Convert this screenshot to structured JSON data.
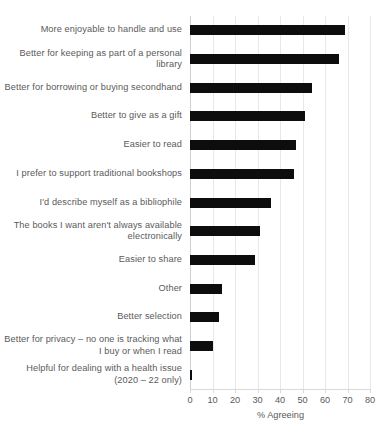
{
  "chart_data": {
    "type": "bar",
    "orientation": "horizontal",
    "title": "",
    "xlabel": "% Agreeing",
    "ylabel": "",
    "xlim": [
      0,
      80
    ],
    "xticks": [
      0,
      10,
      20,
      30,
      40,
      50,
      60,
      70,
      80
    ],
    "grid": true,
    "legend": false,
    "bar_color": "#0d0d0d",
    "categories": [
      "More enjoyable to handle and use",
      "Better for keeping as part of a personal library",
      "Better for borrowing or buying secondhand",
      "Better to give as a gift",
      "Easier to read",
      "I prefer to support traditional bookshops",
      "I'd describe myself as a bibliophile",
      "The books I want aren't always available electronically",
      "Easier to share",
      "Other",
      "Better selection",
      "Better for privacy – no one is tracking what I buy or when I read",
      "Helpful for dealing with a health issue (2020 – 22 only)"
    ],
    "values": [
      69,
      66,
      54,
      51,
      47,
      46,
      36,
      31,
      29,
      14,
      13,
      10,
      1
    ]
  },
  "axis": {
    "x_title": "% Agreeing",
    "tick_labels": [
      "0",
      "10",
      "20",
      "30",
      "40",
      "50",
      "60",
      "70",
      "80"
    ]
  }
}
